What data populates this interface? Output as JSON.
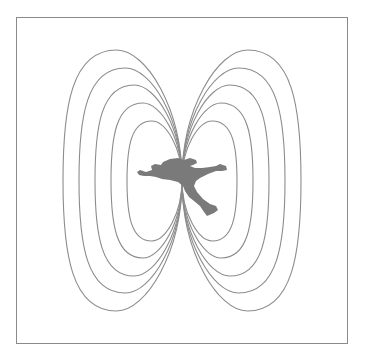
{
  "diagram": {
    "description": "Dipole field lines surrounding a falling person silhouette",
    "colors": {
      "background": "#ffffff",
      "frame": "#8a8a8a",
      "field_lines": "#8c8c8c",
      "silhouette": "#7a7a7a"
    },
    "center": {
      "x": 182,
      "y": 180
    },
    "field_loops": [
      {
        "side": "left",
        "extreme_x": 63,
        "top_y": 50,
        "bottom_y": 311
      },
      {
        "side": "left",
        "extreme_x": 79,
        "top_y": 68,
        "bottom_y": 293
      },
      {
        "side": "left",
        "extreme_x": 95,
        "top_y": 85,
        "bottom_y": 276
      },
      {
        "side": "left",
        "extreme_x": 111,
        "top_y": 103,
        "bottom_y": 258
      },
      {
        "side": "left",
        "extreme_x": 127,
        "top_y": 121,
        "bottom_y": 241
      },
      {
        "side": "right",
        "extreme_x": 301,
        "top_y": 50,
        "bottom_y": 311
      },
      {
        "side": "right",
        "extreme_x": 285,
        "top_y": 68,
        "bottom_y": 293
      },
      {
        "side": "right",
        "extreme_x": 269,
        "top_y": 85,
        "bottom_y": 276
      },
      {
        "side": "right",
        "extreme_x": 253,
        "top_y": 103,
        "bottom_y": 258
      },
      {
        "side": "right",
        "extreme_x": 237,
        "top_y": 121,
        "bottom_y": 241
      }
    ],
    "figure": "falling-person-silhouette"
  }
}
